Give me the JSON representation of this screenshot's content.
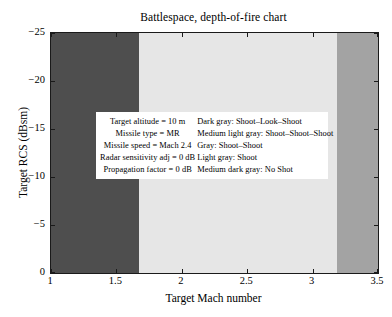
{
  "chart_data": {
    "type": "area",
    "title": "Battlespace, depth-of-fire chart",
    "xlabel": "Target Mach number",
    "ylabel": "Target RCS (dBsm)",
    "xlim": [
      1,
      3.5
    ],
    "ylim": [
      -25,
      0
    ],
    "y_axis_reversed": true,
    "grid": false,
    "legend_position": "inside-center",
    "xticks": [
      "1",
      "1.5",
      "2",
      "2.5",
      "3",
      "3.5"
    ],
    "xtick_values": [
      1,
      1.5,
      2,
      2.5,
      3,
      3.5
    ],
    "yticks": [
      "−25",
      "−20",
      "−15",
      "−10",
      "−5",
      "0"
    ],
    "ytick_values": [
      -25,
      -20,
      -15,
      -10,
      -5,
      0
    ],
    "bands": [
      {
        "label": "Shoot–Look–Shoot",
        "color_name": "Dark gray",
        "color": "#4e4e4e",
        "x_start": 1.0,
        "x_end": 1.67
      },
      {
        "label": "Shoot–Shoot–Shoot",
        "color_name": "Medium light gray",
        "color": "#e6e6e6",
        "x_start": 1.67,
        "x_end": 3.19
      },
      {
        "label": "No Shot",
        "color_name": "Medium dark gray",
        "color": "#a3a3a3",
        "x_start": 3.19,
        "x_end": 3.5
      }
    ]
  },
  "legend": {
    "parameters": [
      "Target altitude = 10 m",
      "Missile type = MR",
      "Missile speed = Mach 2.4",
      "Radar sensitivity adj = 0 dB",
      "Propagation factor = 0 dB"
    ],
    "color_key": [
      "Dark gray: Shoot–Look–Shoot",
      "Medium light gray: Shoot–Shoot–Shoot",
      "Gray: Shoot–Shoot",
      "Light gray: Shoot",
      "Medium dark gray: No Shot"
    ]
  }
}
